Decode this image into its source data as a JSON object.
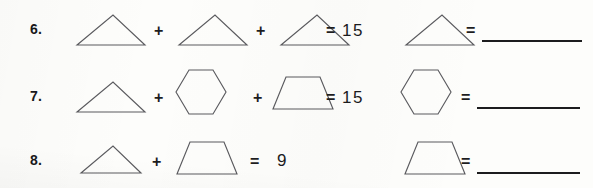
{
  "worksheet": {
    "type": "shape-equation-practice",
    "background_color": "#fdfdfb",
    "ink_color": "#1b1b1d",
    "shape_stroke_color": "#5b5b5f",
    "problems": [
      {
        "number": "6.",
        "equation_shapes": [
          "triangle",
          "triangle",
          "triangle"
        ],
        "operators": [
          "+",
          "+"
        ],
        "equals_sign": "=",
        "sum": "15",
        "answer_prompt_shape": "triangle",
        "answer_equals_sign": "=",
        "answer_value": ""
      },
      {
        "number": "7.",
        "equation_shapes": [
          "triangle",
          "hexagon",
          "trapezoid"
        ],
        "operators": [
          "+",
          "+"
        ],
        "equals_sign": "=",
        "sum": "15",
        "answer_prompt_shape": "hexagon",
        "answer_equals_sign": "=",
        "answer_value": ""
      },
      {
        "number": "8.",
        "equation_shapes": [
          "triangle",
          "trapezoid"
        ],
        "operators": [
          "+"
        ],
        "equals_sign": "=",
        "sum": "9",
        "answer_prompt_shape": "trapezoid",
        "answer_equals_sign": "=",
        "answer_value": ""
      }
    ]
  }
}
